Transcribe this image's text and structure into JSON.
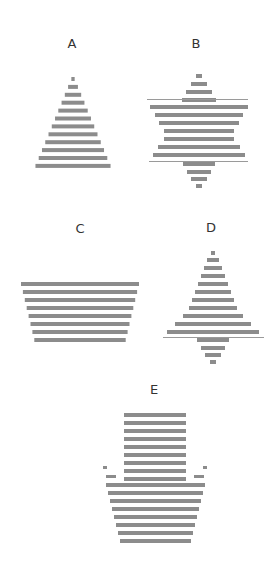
{
  "figure": {
    "stripe_color": "#8c8c8c",
    "line_color": "#9a9a9a",
    "labels": [
      {
        "id": "A",
        "text": "A",
        "x": 72,
        "y": 36
      },
      {
        "id": "B",
        "text": "B",
        "x": 196,
        "y": 36
      },
      {
        "id": "C",
        "text": "C",
        "x": 80,
        "y": 221
      },
      {
        "id": "D",
        "text": "D",
        "x": 211,
        "y": 220
      },
      {
        "id": "E",
        "text": "E",
        "x": 154,
        "y": 382
      }
    ],
    "shapes": [
      {
        "id": "A",
        "kind": "triangle",
        "description": "Striped upward-pointing triangle, 12 stripes"
      },
      {
        "id": "B",
        "kind": "star",
        "description": "Striped six-pointed star with thin horizontal lines at overlap edges"
      },
      {
        "id": "C",
        "kind": "trapezoid",
        "description": "Striped inverted trapezoid, 8 stripes"
      },
      {
        "id": "D",
        "kind": "kite",
        "description": "Striped tall triangle with concave sides above small downward triangle, thin line between"
      },
      {
        "id": "E",
        "kind": "arrow",
        "description": "Striped downward-pointing column over cup-shaped base with wing tips"
      }
    ]
  }
}
